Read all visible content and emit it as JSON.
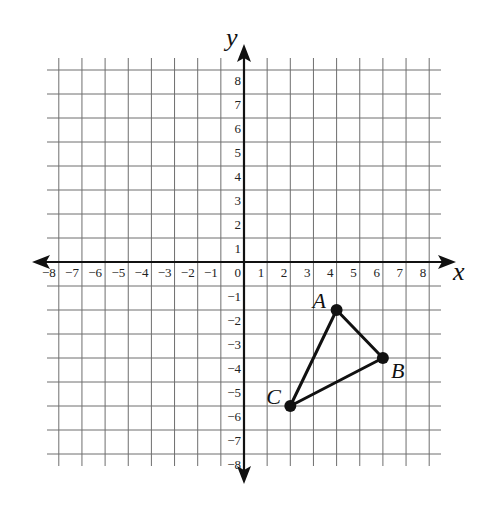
{
  "chart_data": {
    "type": "scatter",
    "title": "",
    "xlabel": "x",
    "ylabel": "y",
    "xlim": [
      -8,
      8
    ],
    "ylim": [
      -8,
      8
    ],
    "grid": true,
    "x_ticks": [
      -8,
      -7,
      -6,
      -5,
      -4,
      -3,
      -2,
      -1,
      0,
      1,
      2,
      3,
      4,
      5,
      6,
      7,
      8
    ],
    "y_ticks": [
      -8,
      -7,
      -6,
      -5,
      -4,
      -3,
      -2,
      -1,
      1,
      2,
      3,
      4,
      5,
      6,
      7,
      8
    ],
    "points": [
      {
        "label": "A",
        "x": 4,
        "y": -2
      },
      {
        "label": "B",
        "x": 6,
        "y": -4
      },
      {
        "label": "C",
        "x": 2,
        "y": -6
      }
    ],
    "polygon": {
      "name": "triangle ABC",
      "vertices": [
        "A",
        "B",
        "C"
      ]
    }
  },
  "axes": {
    "x_label": "x",
    "y_label": "y"
  },
  "colors": {
    "grid": "#6e6e6e",
    "axis": "#111111",
    "shape": "#111111"
  }
}
